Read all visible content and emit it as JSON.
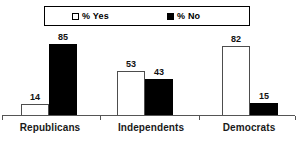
{
  "chart_data": {
    "type": "bar",
    "title": "",
    "subtitle": "",
    "xlabel": "",
    "ylabel": "",
    "ylim": [
      0,
      100
    ],
    "grid": false,
    "legend_position": "top",
    "categories": [
      "Republicans",
      "Independents",
      "Democrats"
    ],
    "series": [
      {
        "name": "% Yes",
        "marker": "white-square",
        "color": "#ffffff",
        "border_color": "#000000",
        "values": [
          14,
          53,
          82
        ]
      },
      {
        "name": "% No",
        "marker": "black-square",
        "color": "#000000",
        "border_color": "#000000",
        "values": [
          85,
          43,
          15
        ]
      }
    ],
    "value_labels": [
      {
        "category": "Republicans",
        "series": "% Yes",
        "text": "14"
      },
      {
        "category": "Republicans",
        "series": "% No",
        "text": "85"
      },
      {
        "category": "Independents",
        "series": "% Yes",
        "text": "53"
      },
      {
        "category": "Independents",
        "series": "% No",
        "text": "43"
      },
      {
        "category": "Democrats",
        "series": "% Yes",
        "text": "82"
      },
      {
        "category": "Democrats",
        "series": "% No",
        "text": "15"
      }
    ]
  },
  "legend": {
    "entries": [
      {
        "label": "% Yes",
        "swatch": "legend-swatch-white"
      },
      {
        "label": "% No",
        "swatch": "legend-swatch-black"
      }
    ]
  },
  "axis": {
    "baseline_color": "#555555",
    "tick_count": 4
  }
}
